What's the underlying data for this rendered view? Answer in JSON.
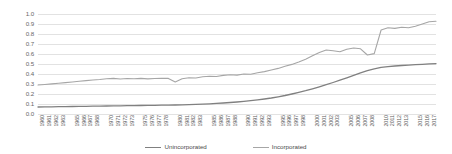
{
  "chart_data": {
    "type": "line",
    "title": "",
    "subtitle": "",
    "xlabel": "",
    "ylabel": "",
    "ylim": [
      0.0,
      1.0
    ],
    "xlim": [
      1960,
      2018
    ],
    "grid": true,
    "legend_position": "bottom-center",
    "ytick_labels": [
      "1.0",
      "0.9",
      "0.8",
      "0.7",
      "0.6",
      "0.5",
      "0.4",
      "0.3",
      "0.2",
      "0.1",
      "0.0"
    ],
    "ytick_values": [
      1.0,
      0.9,
      0.8,
      0.7,
      0.6,
      0.5,
      0.4,
      0.3,
      0.2,
      0.1,
      0.0
    ],
    "x": [
      1960,
      1961,
      1962,
      1963,
      1964,
      1965,
      1966,
      1967,
      1968,
      1969,
      1970,
      1971,
      1972,
      1973,
      1974,
      1975,
      1976,
      1977,
      1978,
      1979,
      1980,
      1981,
      1982,
      1983,
      1984,
      1985,
      1986,
      1987,
      1988,
      1989,
      1990,
      1991,
      1992,
      1993,
      1994,
      1995,
      1996,
      1997,
      1998,
      1999,
      2000,
      2001,
      2002,
      2003,
      2004,
      2005,
      2006,
      2007,
      2008,
      2009,
      2010,
      2011,
      2012,
      2013,
      2014,
      2015,
      2016,
      2017,
      2018
    ],
    "xtick_labels": [
      "1960",
      "1961",
      "1962",
      "1963",
      "1965",
      "1966",
      "1967",
      "1968",
      "1970",
      "1971",
      "1972",
      "1973",
      "1975",
      "1976",
      "1977",
      "1978",
      "1980",
      "1981",
      "1982",
      "1983",
      "1985",
      "1986",
      "1987",
      "1988",
      "1990",
      "1991",
      "1992",
      "1993",
      "1995",
      "1996",
      "1997",
      "1998",
      "2000",
      "2001",
      "2002",
      "2003",
      "2005",
      "2006",
      "2007",
      "2008",
      "2010",
      "2011",
      "2012",
      "2013",
      "2015",
      "2016",
      "2017"
    ],
    "xtick_values": [
      1960,
      1961,
      1962,
      1963,
      1965,
      1966,
      1967,
      1968,
      1970,
      1971,
      1972,
      1973,
      1975,
      1976,
      1977,
      1978,
      1980,
      1981,
      1982,
      1983,
      1985,
      1986,
      1987,
      1988,
      1990,
      1991,
      1992,
      1993,
      1995,
      1996,
      1997,
      1998,
      2000,
      2001,
      2002,
      2003,
      2005,
      2006,
      2007,
      2008,
      2010,
      2011,
      2012,
      2013,
      2015,
      2016,
      2017
    ],
    "series": [
      {
        "name": "Unincorporated",
        "color": "#808080",
        "width": 1.3,
        "values": [
          0.07,
          0.071,
          0.072,
          0.073,
          0.074,
          0.075,
          0.076,
          0.077,
          0.078,
          0.079,
          0.08,
          0.081,
          0.082,
          0.083,
          0.084,
          0.085,
          0.086,
          0.087,
          0.088,
          0.089,
          0.09,
          0.092,
          0.094,
          0.096,
          0.099,
          0.102,
          0.106,
          0.11,
          0.115,
          0.12,
          0.126,
          0.133,
          0.141,
          0.15,
          0.16,
          0.172,
          0.185,
          0.2,
          0.216,
          0.233,
          0.252,
          0.272,
          0.293,
          0.315,
          0.338,
          0.362,
          0.387,
          0.412,
          0.434,
          0.452,
          0.466,
          0.474,
          0.48,
          0.485,
          0.489,
          0.493,
          0.497,
          0.501,
          0.503
        ]
      },
      {
        "name": "Incorporated",
        "color": "#a6a6a6",
        "width": 1.1,
        "values": [
          0.29,
          0.295,
          0.301,
          0.307,
          0.314,
          0.32,
          0.327,
          0.334,
          0.34,
          0.345,
          0.352,
          0.356,
          0.35,
          0.355,
          0.352,
          0.356,
          0.351,
          0.355,
          0.358,
          0.356,
          0.32,
          0.352,
          0.362,
          0.36,
          0.372,
          0.378,
          0.375,
          0.386,
          0.392,
          0.389,
          0.4,
          0.398,
          0.412,
          0.424,
          0.44,
          0.456,
          0.478,
          0.496,
          0.52,
          0.548,
          0.582,
          0.616,
          0.64,
          0.632,
          0.622,
          0.648,
          0.66,
          0.652,
          0.59,
          0.604,
          0.84,
          0.862,
          0.856,
          0.868,
          0.862,
          0.878,
          0.9,
          0.922,
          0.928
        ]
      }
    ]
  },
  "legend": {
    "items": [
      {
        "label": "Unincorporated",
        "color": "#808080"
      },
      {
        "label": "Incorporated",
        "color": "#a6a6a6"
      }
    ]
  }
}
